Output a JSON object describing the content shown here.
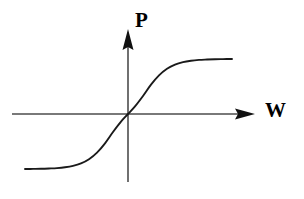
{
  "figure": {
    "width": 304,
    "height": 199,
    "background_color": "#ffffff",
    "stroke_color": "#1a1a1a",
    "axis_color": "#4d4d4d"
  },
  "axes": {
    "vertical": {
      "label": "P",
      "name": "p-axis",
      "x": 128,
      "y_top": 29,
      "y_bottom": 182,
      "arrow": "up"
    },
    "horizontal": {
      "label": "W",
      "name": "w-axis",
      "y": 114,
      "x_left": 12,
      "x_right": 255,
      "arrow": "right"
    },
    "origin": {
      "x": 128,
      "y": 114
    }
  },
  "chart_data": {
    "type": "line",
    "title": "",
    "xlabel": "W",
    "ylabel": "P",
    "grid": false,
    "legend": null,
    "annotations": [],
    "xlim": [
      -103,
      104
    ],
    "ylim": [
      -55,
      55
    ],
    "xtick_labels": [],
    "ytick_labels": [],
    "series": [
      {
        "name": "sigmoid",
        "description": "Odd sigmoid (tanh-like) saturating curve through the origin",
        "color": "#1a1a1a",
        "x": [
          -103,
          -95,
          -87,
          -79,
          -71,
          -63,
          -55,
          -47,
          -39,
          -31,
          -23,
          -15,
          -7,
          0,
          7,
          15,
          23,
          31,
          39,
          47,
          55,
          63,
          71,
          79,
          87,
          95,
          104
        ],
        "y": [
          -55.0,
          -54.9,
          -54.8,
          -54.5,
          -54.1,
          -53.3,
          -51.9,
          -49.4,
          -45.2,
          -38.6,
          -29.3,
          -18.0,
          -7.6,
          0.0,
          7.6,
          18.0,
          29.3,
          38.6,
          45.2,
          49.4,
          51.9,
          53.3,
          54.1,
          54.5,
          54.8,
          54.9,
          55.0
        ]
      }
    ],
    "plateaus": {
      "lower_value": -55,
      "upper_value": 55,
      "lower_pixel_y": 169,
      "upper_pixel_y": 59,
      "left_start_pixel_x": 25,
      "right_end_pixel_x": 232
    }
  }
}
